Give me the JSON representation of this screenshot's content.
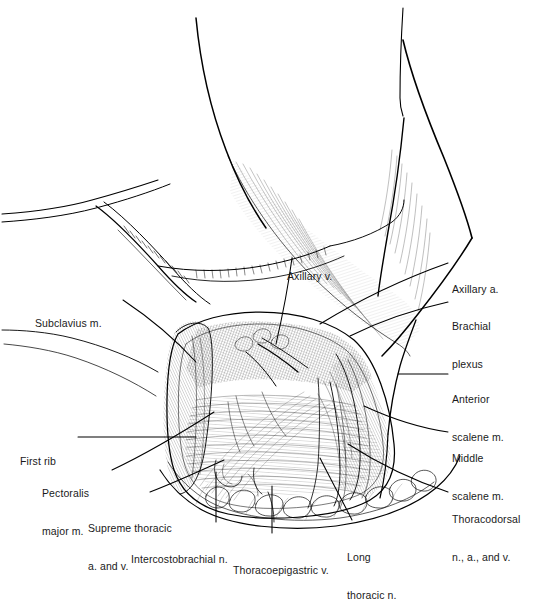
{
  "figure": {
    "kind": "anatomical-line-drawing",
    "view": "anterior view of left axilla with arm abducted",
    "style": "black-and-white pen-and-ink stipple and hatch illustration",
    "background_color": "#ffffff",
    "ink_color": "#000000",
    "label_text_color": "#1a1a1a"
  },
  "labels": [
    {
      "id": "subclavius",
      "text": "Subclavius m.",
      "lines": [
        "Subclavius m."
      ],
      "side": "left",
      "x": 35,
      "y": 292
    },
    {
      "id": "first-rib",
      "text": "First rib",
      "lines": [
        "First rib"
      ],
      "side": "left",
      "x": 20,
      "y": 430
    },
    {
      "id": "pectoralis-major",
      "text": "Pectoralis major m.",
      "lines": [
        "Pectoralis",
        "major m."
      ],
      "side": "left",
      "x": 42,
      "y": 462
    },
    {
      "id": "supreme-thoracic",
      "text": "Supreme thoracic a. and v.",
      "lines": [
        "Supreme thoracic",
        "a. and v."
      ],
      "side": "bottom-left",
      "x": 88,
      "y": 497
    },
    {
      "id": "intercostobrachial",
      "text": "Intercostobrachial n.",
      "lines": [
        "Intercostobrachial n."
      ],
      "side": "bottom",
      "x": 131,
      "y": 528
    },
    {
      "id": "thoracoepigastric",
      "text": "Thoracoepigastric v.",
      "lines": [
        "Thoracoepigastric v."
      ],
      "side": "bottom",
      "x": 233,
      "y": 539
    },
    {
      "id": "long-thoracic",
      "text": "Long thoracic n.",
      "lines": [
        "Long",
        "thoracic n."
      ],
      "side": "bottom",
      "x": 347,
      "y": 526
    },
    {
      "id": "axillary-vein",
      "text": "Axillary v.",
      "lines": [
        "Axillary v."
      ],
      "side": "top",
      "x": 287,
      "y": 245
    },
    {
      "id": "axillary-artery",
      "text": "Axillary a.",
      "lines": [
        "Axillary a."
      ],
      "side": "right",
      "x": 452,
      "y": 258
    },
    {
      "id": "brachial-plexus",
      "text": "Brachial plexus",
      "lines": [
        "Brachial",
        "plexus"
      ],
      "side": "right",
      "x": 452,
      "y": 295
    },
    {
      "id": "anterior-scalene",
      "text": "Anterior scalene m.",
      "lines": [
        "Anterior",
        "scalene m."
      ],
      "side": "right",
      "x": 452,
      "y": 368
    },
    {
      "id": "middle-scalene",
      "text": "Middle scalene m.",
      "lines": [
        "Middle",
        "scalene m."
      ],
      "side": "right",
      "x": 452,
      "y": 427
    },
    {
      "id": "thoracodorsal",
      "text": "Thoracodorsal n., a., and v.",
      "lines": [
        "Thoracodorsal",
        "n., a., and v."
      ],
      "side": "right",
      "x": 452,
      "y": 488
    }
  ],
  "structures": [
    {
      "id": "arm",
      "name": "abducted upper arm / shoulder contour"
    },
    {
      "id": "chest-wall",
      "name": "lateral chest wall"
    },
    {
      "id": "clavicle",
      "name": "clavicle and subclavius region"
    },
    {
      "id": "axillary-cavity",
      "name": "opened axillary fossa"
    },
    {
      "id": "serratus-anterior",
      "name": "serratus anterior muscle fibers"
    },
    {
      "id": "latissimus-dorsi",
      "name": "latissimus dorsi border"
    },
    {
      "id": "skin-flap",
      "name": "reflected skin and fat flap with lobular fat"
    },
    {
      "id": "vessels",
      "name": "axillary vessels and nerves in apex"
    }
  ]
}
